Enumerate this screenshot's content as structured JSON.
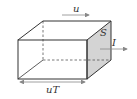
{
  "diagram": {
    "type": "cuboid-flux-tube",
    "labels": {
      "velocity": "u",
      "area": "S",
      "current": "I",
      "length": "uT"
    },
    "colors": {
      "line": "#333333",
      "shaded_face": "#d4d4d4",
      "arrow": "#888888"
    }
  }
}
